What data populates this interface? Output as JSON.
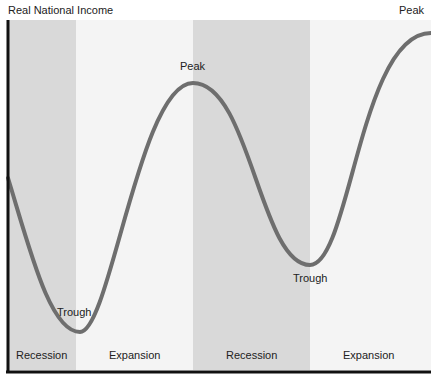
{
  "diagram": {
    "y_axis_label": "Real National Income",
    "phases": [
      {
        "label": "Recession",
        "x0": 8,
        "x1": 76,
        "fill": "#d9d9d9"
      },
      {
        "label": "Expansion",
        "x0": 76,
        "x1": 193,
        "fill": "#f4f4f4"
      },
      {
        "label": "Recession",
        "x0": 193,
        "x1": 310,
        "fill": "#d9d9d9"
      },
      {
        "label": "Expansion",
        "x0": 310,
        "x1": 431,
        "fill": "#f4f4f4"
      }
    ],
    "points": [
      {
        "label": "Trough",
        "x": 80,
        "y": 332
      },
      {
        "label": "Peak",
        "x": 193,
        "y": 83
      },
      {
        "label": "Trough",
        "x": 310,
        "y": 265
      },
      {
        "label": "Peak",
        "x": 431,
        "y": 33
      }
    ],
    "colors": {
      "curve": "#6e6e6e",
      "axis": "#111111",
      "recession_band": "#d9d9d9",
      "expansion_band": "#f4f4f4"
    }
  },
  "labels": {
    "axis": "Real National Income",
    "peak1": "Peak",
    "peak2": "Peak",
    "trough1": "Trough",
    "trough2": "Trough",
    "phase1": "Recession",
    "phase2": "Expansion",
    "phase3": "Recession",
    "phase4": "Expansion"
  }
}
